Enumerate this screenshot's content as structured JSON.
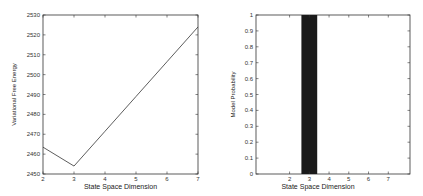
{
  "chart_data": [
    {
      "type": "line",
      "title": "",
      "xlabel": "State Space Dimension",
      "ylabel": "Variational Free Energy",
      "x": [
        2,
        3,
        4,
        5,
        6,
        7
      ],
      "series": [
        {
          "name": "Variational Free Energy",
          "values": [
            2463.5,
            2454,
            2471.5,
            2489,
            2506.5,
            2524
          ]
        }
      ],
      "xlim": [
        2,
        7
      ],
      "ylim": [
        2450,
        2530
      ],
      "xticks": [
        "2",
        "3",
        "4",
        "5",
        "6",
        "7"
      ],
      "yticks": [
        "2450",
        "2460",
        "2470",
        "2480",
        "2490",
        "2500",
        "2510",
        "2520",
        "2530"
      ],
      "grid": false,
      "line_color": "#333333"
    },
    {
      "type": "bar",
      "title": "",
      "xlabel": "State Space Dimension",
      "ylabel": "Model Probability",
      "categories": [
        "2",
        "3",
        "4",
        "5",
        "6",
        "7"
      ],
      "values": [
        0,
        1,
        0,
        0,
        0,
        0
      ],
      "xlim": [
        0.3,
        8.1
      ],
      "ylim": [
        0,
        1
      ],
      "xticks": [
        "2",
        "3",
        "4",
        "5",
        "6",
        "7"
      ],
      "yticks": [
        "0",
        "0.1",
        "0.2",
        "0.3",
        "0.4",
        "0.5",
        "0.6",
        "0.7",
        "0.8",
        "0.9",
        "1"
      ],
      "grid": false,
      "bar_color": "#1a1a1a"
    }
  ]
}
